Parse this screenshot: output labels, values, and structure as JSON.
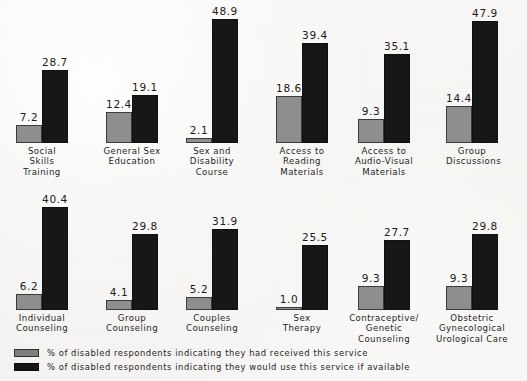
{
  "chart_data": {
    "type": "bar",
    "title": "",
    "subtitle": "",
    "xlabel": "",
    "ylabel": "",
    "ylim": [
      0,
      50
    ],
    "grid": false,
    "legend_position": "bottom-left",
    "orientation": "vertical",
    "value_labels": true,
    "categories": [
      "Social Skills Training",
      "General Sex Education",
      "Sex and Disability Course",
      "Access to Reading Materials",
      "Access to Audio-Visual Materials",
      "Group Discussions",
      "Individual Counseling",
      "Group Counseling",
      "Couples Counseling",
      "Sex Therapy",
      "Contraceptive/ Genetic Counseling",
      "Obstetric Gynecological Urological Care"
    ],
    "series": [
      {
        "name": "% of disabled respondents indicating they had received this service",
        "color": "#8e8e8c",
        "values": [
          7.2,
          12.4,
          2.1,
          18.6,
          9.3,
          14.4,
          6.2,
          4.1,
          5.2,
          1.0,
          9.3,
          9.3
        ]
      },
      {
        "name": "% of disabled respondents indicating they would use this service if available",
        "color": "#171717",
        "values": [
          28.7,
          19.1,
          48.9,
          39.4,
          35.1,
          47.9,
          40.4,
          29.8,
          31.9,
          25.5,
          27.7,
          29.8
        ]
      }
    ],
    "rows": [
      {
        "groups": [
          {
            "label_lines": [
              "Social",
              "Skills",
              "Training"
            ],
            "received": "7.2",
            "would_use": "28.7",
            "received_value": 7.2,
            "would_use_value": 28.7
          },
          {
            "label_lines": [
              "General Sex",
              "Education"
            ],
            "received": "12.4",
            "would_use": "19.1",
            "received_value": 12.4,
            "would_use_value": 19.1
          },
          {
            "label_lines": [
              "Sex and",
              "Disability",
              "Course"
            ],
            "received": "2.1",
            "would_use": "48.9",
            "received_value": 2.1,
            "would_use_value": 48.9
          },
          {
            "label_lines": [
              "Access to",
              "Reading",
              "Materials"
            ],
            "received": "18.6",
            "would_use": "39.4",
            "received_value": 18.6,
            "would_use_value": 39.4
          },
          {
            "label_lines": [
              "Access to",
              "Audio-Visual",
              "Materials"
            ],
            "received": "9.3",
            "would_use": "35.1",
            "received_value": 9.3,
            "would_use_value": 35.1
          },
          {
            "label_lines": [
              "Group",
              "Discussions"
            ],
            "received": "14.4",
            "would_use": "47.9",
            "received_value": 14.4,
            "would_use_value": 47.9
          }
        ]
      },
      {
        "groups": [
          {
            "label_lines": [
              "Individual",
              "Counseling"
            ],
            "received": "6.2",
            "would_use": "40.4",
            "received_value": 6.2,
            "would_use_value": 40.4
          },
          {
            "label_lines": [
              "Group",
              "Counseling"
            ],
            "received": "4.1",
            "would_use": "29.8",
            "received_value": 4.1,
            "would_use_value": 29.8
          },
          {
            "label_lines": [
              "Couples",
              "Counseling"
            ],
            "received": "5.2",
            "would_use": "31.9",
            "received_value": 5.2,
            "would_use_value": 31.9
          },
          {
            "label_lines": [
              "Sex",
              "Therapy"
            ],
            "received": "1.0",
            "would_use": "25.5",
            "received_value": 1.0,
            "would_use_value": 25.5
          },
          {
            "label_lines": [
              "Contraceptive/",
              "Genetic",
              "Counseling"
            ],
            "received": "9.3",
            "would_use": "27.7",
            "received_value": 9.3,
            "would_use_value": 27.7
          },
          {
            "label_lines": [
              "Obstetric",
              "Gynecological",
              "Urological Care"
            ],
            "received": "9.3",
            "would_use": "29.8",
            "received_value": 9.3,
            "would_use_value": 29.8
          }
        ]
      }
    ]
  },
  "legend": {
    "items": [
      {
        "swatch": "received",
        "text": "% of disabled respondents indicating they had received this service"
      },
      {
        "swatch": "would-use",
        "text": "% of disabled respondents indicating they would use this service if available"
      }
    ]
  },
  "colors": {
    "background": "#f3f2f0",
    "received_bar": "#8e8e8c",
    "would_use_bar": "#171717",
    "text": "#1a1a1a"
  }
}
